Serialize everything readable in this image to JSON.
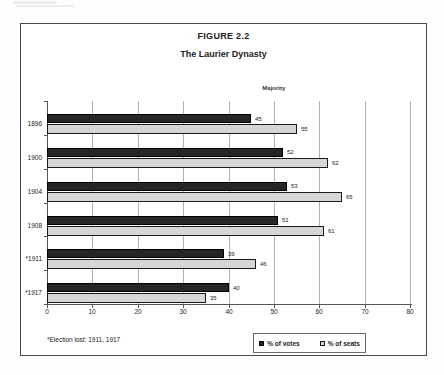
{
  "page": {
    "title": "FIGURE 2.2",
    "subtitle": "The Laurier Dynasty",
    "majority_label": "Majority",
    "footnote": "*Election lost: 1911, 1917"
  },
  "legend": {
    "votes_label": "% of votes",
    "seats_label": "% of seats"
  },
  "colors": {
    "votes_bar": "#262626",
    "seats_bar": "#d6d6d6",
    "bar_border": "#000000",
    "gridline": "#b3b3b3",
    "axis": "#555555",
    "frame_border": "#4a4a4a"
  },
  "chart_data": {
    "type": "bar",
    "orientation": "horizontal",
    "title": "FIGURE 2.2",
    "subtitle": "The Laurier Dynasty",
    "categories": [
      "1896",
      "1900",
      "1904",
      "1908",
      "*1911",
      "*1917"
    ],
    "series": [
      {
        "name": "% of votes",
        "values": [
          45,
          52,
          53,
          51,
          39,
          40
        ]
      },
      {
        "name": "% of seats",
        "values": [
          55,
          62,
          65,
          61,
          46,
          35
        ]
      }
    ],
    "xlabel": "",
    "ylabel": "",
    "xlim": [
      0,
      80
    ],
    "xticks": [
      0,
      10,
      20,
      30,
      40,
      50,
      60,
      70,
      80
    ],
    "grid": true,
    "value_labels": true,
    "annotations": [
      {
        "text": "Majority",
        "x": 50
      }
    ],
    "legend_position": "bottom-right",
    "footnote": "*Election lost: 1911, 1917"
  }
}
